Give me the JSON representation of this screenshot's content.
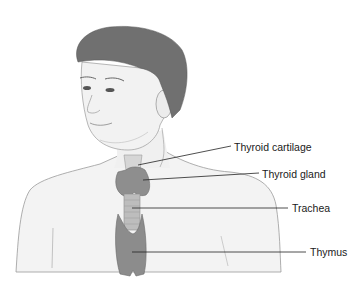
{
  "figure": {
    "colors": {
      "background": "#ffffff",
      "skin": "#f2f2f2",
      "skin_shade": "#e2e2e2",
      "outline": "#8a8a8a",
      "hair": "#6e6e6e",
      "gland": "#8c8c8c",
      "trachea": "#b8b8b8",
      "leader_line": "#222222",
      "label_text": "#1a1a1a"
    }
  },
  "labels": [
    {
      "id": "thyroid-cartilage",
      "text": "Thyroid cartilage",
      "x": 234,
      "y": 141
    },
    {
      "id": "thyroid-gland",
      "text": "Thyroid gland",
      "x": 262,
      "y": 168
    },
    {
      "id": "trachea",
      "text": "Trachea",
      "x": 292,
      "y": 202
    },
    {
      "id": "thymus",
      "text": "Thymus",
      "x": 310,
      "y": 246
    }
  ]
}
